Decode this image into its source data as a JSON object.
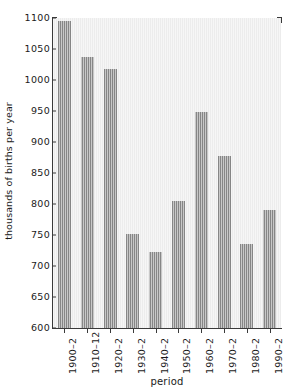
{
  "chart_data": {
    "type": "bar",
    "title": "",
    "xlabel": "period",
    "ylabel": "thousands of births per year",
    "categories": [
      "1900–2",
      "1910–12",
      "1920–2",
      "1930–2",
      "1940–2",
      "1950–2",
      "1960–2",
      "1970–2",
      "1980–2",
      "1990–2"
    ],
    "values": [
      1095,
      1037,
      1018,
      752,
      723,
      805,
      948,
      878,
      735,
      791
    ],
    "ylim": [
      600,
      1100
    ],
    "ytick_labels": [
      "600",
      "650",
      "700",
      "750",
      "800",
      "850",
      "900",
      "950",
      "1000",
      "1050",
      "1100"
    ],
    "ytick_values": [
      600,
      650,
      700,
      750,
      800,
      850,
      900,
      950,
      1000,
      1050,
      1100
    ],
    "grid": false,
    "legend": "none",
    "series_name": "births",
    "bar_color": "#868686",
    "plot_background": "#ececec",
    "axis_color": "#3a3a3a"
  },
  "figure": {
    "top_artifact_text": ""
  }
}
